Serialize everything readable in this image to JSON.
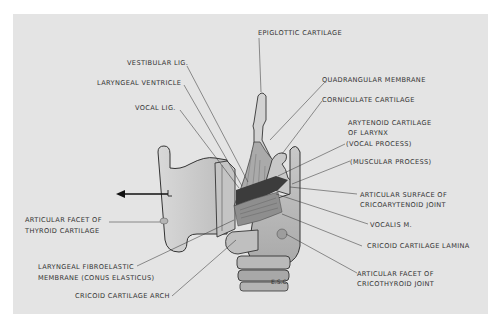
{
  "diagram": {
    "title": "",
    "signature": "E.S.C.",
    "colors": {
      "background": "#e4e4e4",
      "line": "#3a3a3a",
      "text": "#333333",
      "cartilage_fill": "#cfcfcf"
    },
    "labels": {
      "epiglottic_cartilage": "EPIGLOTTIC CARTILAGE",
      "vestibular_lig": "VESTIBULAR LIG.",
      "laryngeal_ventricle": "LARYNGEAL VENTRICLE",
      "vocal_lig": "VOCAL LIG.",
      "quadrangular_membrane": "QUADRANGULAR MEMBRANE",
      "corniculate_cartilage": "CORNICULATE CARTILAGE",
      "arytenoid_line1": "ARYTENOID CARTILAGE",
      "arytenoid_line2": "OF LARYNX",
      "vocal_process": "(VOCAL PROCESS)",
      "muscular_process": "(MUSCULAR PROCESS)",
      "articular_surface_line1": "ARTICULAR SURFACE OF",
      "articular_surface_line2": "CRICOARYTENOID JOINT",
      "vocalis_m": "VOCALIS M.",
      "cricoid_lamina": "CRICOID CARTILAGE LAMINA",
      "facet_cricothyroid_line1": "ARTICULAR FACET OF",
      "facet_cricothyroid_line2": "CRICOTHYROID JOINT",
      "facet_thyroid_line1": "ARTICULAR FACET OF",
      "facet_thyroid_line2": "THYROID CARTILAGE",
      "conus_line1": "LARYNGEAL FIBROELASTIC",
      "conus_line2": "MEMBRANE (CONUS ELASTICUS)",
      "cricoid_arch": "CRICOID CARTILAGE ARCH"
    }
  }
}
